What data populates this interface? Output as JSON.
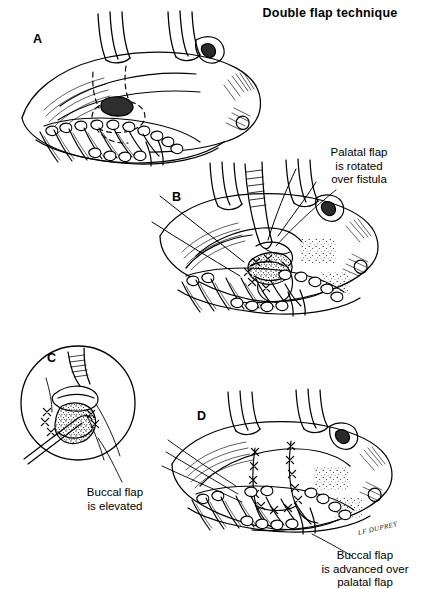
{
  "figure": {
    "title": "Double flap technique",
    "background_color": "#ffffff",
    "ink_color": "#000000",
    "type": "surgical-line-illustration"
  },
  "panels": [
    {
      "id": "A",
      "label": "A",
      "label_x": 33,
      "label_y": 32,
      "description": "Intraoral view of hard palate and alveolar ridge with oronasal fistula and dashed planned incision outlines"
    },
    {
      "id": "B",
      "label": "B",
      "label_x": 172,
      "label_y": 190,
      "description": "Palatal flap raised, rotated and sutured over the fistula; retractors and suture needle in view"
    },
    {
      "id": "C",
      "label": "C",
      "label_x": 47,
      "label_y": 351,
      "description": "Circular magnified inset showing elevation of the buccal flap with instrument and sutures"
    },
    {
      "id": "D",
      "label": "D",
      "label_x": 197,
      "label_y": 409,
      "description": "Completed repair: buccal flap advanced over palatal flap with interrupted sutures"
    }
  ],
  "callouts": [
    {
      "name": "palatal-flap-callout",
      "lines": [
        "Palatal flap",
        "is rotated",
        "over fistula"
      ],
      "text": "Palatal flap is rotated over fistula",
      "x": 303,
      "y": 146,
      "width": 112,
      "align": "center"
    },
    {
      "name": "buccal-flap-elevated-callout",
      "lines": [
        "Buccal flap",
        "is elevated"
      ],
      "text": "Buccal flap is elevated",
      "x": 62,
      "y": 486,
      "width": 106,
      "align": "center"
    },
    {
      "name": "buccal-flap-advanced-callout",
      "lines": [
        "Buccal flap",
        "is advanced over",
        "palatal flap"
      ],
      "text": "Buccal flap is advanced over palatal flap",
      "x": 305,
      "y": 549,
      "width": 120,
      "align": "center"
    }
  ],
  "signature": {
    "text": "LF DUPREY",
    "x": 358,
    "y": 529
  }
}
